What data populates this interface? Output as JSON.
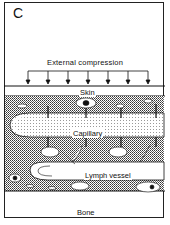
{
  "figure": {
    "panel_label": "C",
    "title": "External compression",
    "layers": {
      "skin": "Skin",
      "capillary": "Capillary",
      "lymph_vessel": "Lymph vessel",
      "bone": "Bone"
    },
    "arrow_count": 7,
    "colors": {
      "line": "#111111",
      "background": "#ffffff",
      "tissue_pattern": "#555555"
    }
  }
}
